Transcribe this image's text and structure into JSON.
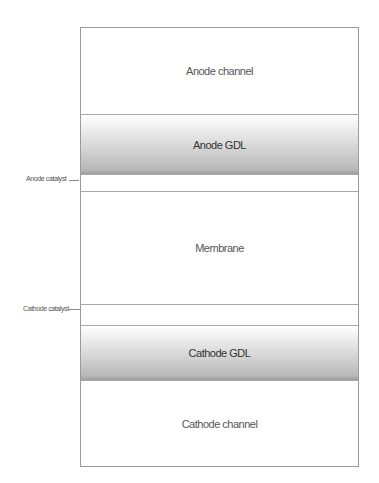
{
  "diagram": {
    "layers": [
      {
        "label": "Anode channel"
      },
      {
        "label": "Anode GDL"
      },
      {
        "label": ""
      },
      {
        "label": "Membrane"
      },
      {
        "label": ""
      },
      {
        "label": "Cathode GDL"
      },
      {
        "label": "Cathode channel"
      }
    ],
    "side_labels": {
      "anode_catalyst": "Anode catalyst",
      "cathode_catalyst": "Cathode catalyst"
    }
  }
}
